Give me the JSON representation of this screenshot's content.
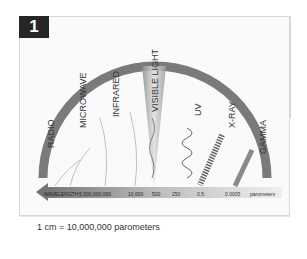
{
  "figure": {
    "number": "1",
    "bands": [
      {
        "name": "RADIO"
      },
      {
        "name": "MICROWAVE"
      },
      {
        "name": "INFRARED"
      },
      {
        "name": "VISIBLE LIGHT"
      },
      {
        "name": "UV"
      },
      {
        "name": "X-RAY"
      },
      {
        "name": "GAMMA"
      }
    ],
    "axis": {
      "label": "WAVELENGTH",
      "ticks": [
        "5,000,000,000",
        "10,000",
        "500",
        "250",
        "0.5",
        "0.0005"
      ],
      "unit": "parometers"
    },
    "scale_note": "1 cm = 10,000,000 parometers"
  }
}
